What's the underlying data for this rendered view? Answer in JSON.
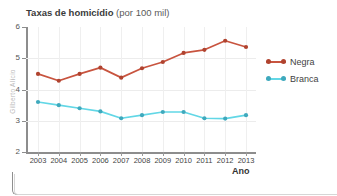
{
  "top_strip": {
    "text": "· · · · · · · · · · ·"
  },
  "credit": {
    "text": "Gilberto Alício"
  },
  "title": {
    "main": "Taxas de homicídio",
    "sub": "(por 100 mil)"
  },
  "axes": {
    "x_name": "Ano",
    "y_ticks": [
      "6",
      "5",
      "4",
      "3",
      "2"
    ],
    "x_ticks": [
      "2003",
      "2004",
      "2005",
      "2006",
      "2007",
      "2008",
      "2009",
      "2010",
      "2011",
      "2012",
      "2013"
    ]
  },
  "legend": {
    "items": [
      {
        "label": "Negra",
        "color": "#c8543f"
      },
      {
        "label": "Branca",
        "color": "#62d7e6"
      }
    ]
  },
  "colors": {
    "negra": "#c8543f",
    "branca": "#62d7e6",
    "negra_marker": "#b0432f",
    "branca_marker": "#3fa9bd",
    "axis": "#8d8d8d",
    "grid": "#ececec"
  },
  "chart_data": {
    "type": "line",
    "title": "Taxas de homicídio (por 100 mil)",
    "xlabel": "Ano",
    "ylabel": "",
    "categories": [
      "2003",
      "2004",
      "2005",
      "2006",
      "2007",
      "2008",
      "2009",
      "2010",
      "2011",
      "2012",
      "2013"
    ],
    "x": [
      2003,
      2004,
      2005,
      2006,
      2007,
      2008,
      2009,
      2010,
      2011,
      2012,
      2013
    ],
    "ylim": [
      2,
      6
    ],
    "yticks": [
      2,
      3,
      4,
      5,
      6
    ],
    "grid": true,
    "legend_position": "right",
    "series": [
      {
        "name": "Negra",
        "color": "#c8543f",
        "values": [
          4.5,
          4.28,
          4.5,
          4.7,
          4.38,
          4.68,
          4.88,
          5.17,
          5.27,
          5.56,
          5.36
        ]
      },
      {
        "name": "Branca",
        "color": "#62d7e6",
        "values": [
          3.6,
          3.5,
          3.4,
          3.3,
          3.08,
          3.18,
          3.28,
          3.28,
          3.08,
          3.07,
          3.18
        ]
      }
    ]
  }
}
